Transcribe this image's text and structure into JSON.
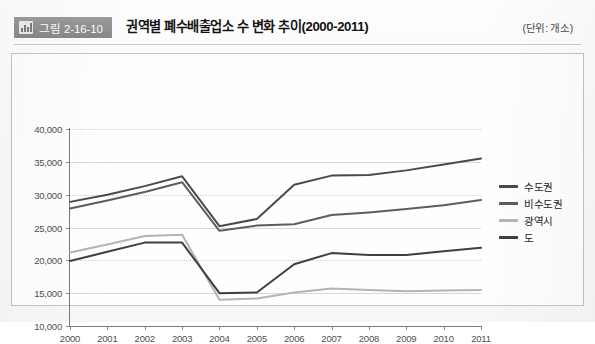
{
  "header": {
    "badge_label": "그림 2-16-10",
    "badge_icon": "bar-chart-icon",
    "title": "권역별 폐수배출업소 수 변화 추이(2000-2011)",
    "unit": "(단위: 개소)"
  },
  "colors": {
    "series_sudogwon": "#4a4a4a",
    "series_bisudogwon": "#5d5d5d",
    "series_gwangyeoksi": "#b4b4b4",
    "series_do": "#3f3f3f",
    "grid": "#d8d8d8",
    "axis": "#7b7b7b",
    "badge_bg": "#8d8d8d"
  },
  "chart_data": {
    "type": "line",
    "title": "권역별 폐수배출업소 수 변화 추이(2000-2011)",
    "subtitle": "",
    "xlabel": "",
    "ylabel": "",
    "unit": "개소",
    "grid": true,
    "legend_position": "right",
    "ylim": [
      10000,
      40000
    ],
    "yticks": [
      10000,
      15000,
      20000,
      25000,
      30000,
      35000,
      40000
    ],
    "ytick_labels": [
      "10,000",
      "15,000",
      "20,000",
      "25,000",
      "30,000",
      "35,000",
      "40,000"
    ],
    "categories": [
      2000,
      2001,
      2002,
      2003,
      2004,
      2005,
      2006,
      2007,
      2008,
      2009,
      2010,
      2011
    ],
    "xtick_labels": [
      "2000",
      "2001",
      "2002",
      "2003",
      "2004",
      "2005",
      "2006",
      "2007",
      "2008",
      "2009",
      "2010",
      "2011"
    ],
    "series": [
      {
        "name": "수도권",
        "color": "#4a4a4a",
        "values": [
          28900,
          30000,
          31300,
          32800,
          25200,
          26300,
          31500,
          32900,
          33000,
          33700,
          34600,
          35500
        ]
      },
      {
        "name": "비수도권",
        "color": "#5d5d5d",
        "values": [
          27900,
          29100,
          30400,
          31900,
          24500,
          25300,
          25500,
          26900,
          27300,
          27800,
          28400,
          29200
        ]
      },
      {
        "name": "광역시",
        "color": "#b4b4b4",
        "values": [
          21200,
          22400,
          23700,
          23900,
          14000,
          14200,
          15100,
          15700,
          15500,
          15300,
          15400,
          15500
        ]
      },
      {
        "name": "도",
        "color": "#3f3f3f",
        "values": [
          19900,
          21300,
          22700,
          22700,
          15000,
          15100,
          19400,
          21100,
          20800,
          20800,
          21400,
          21900
        ]
      }
    ]
  },
  "legend": {
    "items": [
      {
        "label": "수도권",
        "color": "#4a4a4a"
      },
      {
        "label": "비수도권",
        "color": "#5d5d5d"
      },
      {
        "label": "광역시",
        "color": "#b4b4b4"
      },
      {
        "label": "도",
        "color": "#3f3f3f"
      }
    ]
  }
}
